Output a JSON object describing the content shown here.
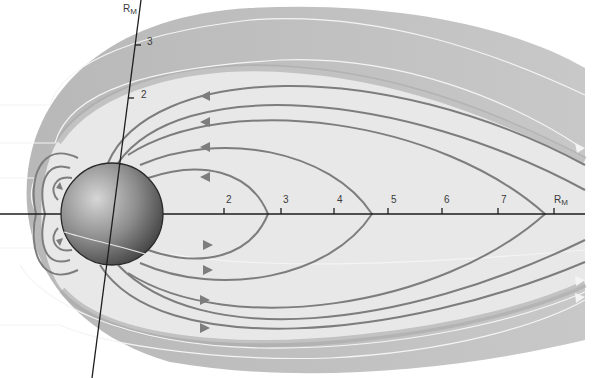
{
  "diagram": {
    "colors": {
      "background": "#ffffff",
      "magnetosheath": "#bdbdbd",
      "magnetosphere_interior": "#e8e8e8",
      "field_lines": "#7d7d7d",
      "solar_wind_flow_lines": "#f4f4f4",
      "planet_light": "#d6d6d6",
      "planet_dark": "#3c3c3c",
      "axis": "#1e1e1e"
    },
    "horizontal_axis": {
      "unit_label": "R",
      "unit_subscript": "M",
      "ticks": [
        {
          "label": "2",
          "x": 224
        },
        {
          "label": "3",
          "x": 281
        },
        {
          "label": "4",
          "x": 334
        },
        {
          "label": "5",
          "x": 388
        },
        {
          "label": "6",
          "x": 442
        },
        {
          "label": "7",
          "x": 498
        }
      ],
      "unit_tick_x": 554
    },
    "tilted_axis": {
      "unit_label": "R",
      "unit_subscript": "M",
      "ticks": [
        {
          "label": "3"
        },
        {
          "label": "2"
        }
      ]
    },
    "planet": {
      "name": "planet-sphere",
      "cx": 112,
      "cy": 214,
      "r": 51
    }
  }
}
